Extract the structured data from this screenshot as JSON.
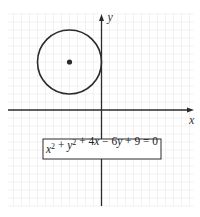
{
  "figure": {
    "type": "circle-on-coordinate-plane",
    "axes": {
      "x_label": "x",
      "y_label": "y"
    },
    "circle": {
      "center": [
        -2,
        3
      ],
      "radius": 2
    },
    "equation": {
      "parts": [
        {
          "t": "x",
          "i": true
        },
        {
          "t": "2",
          "sup": true
        },
        {
          "t": " + "
        },
        {
          "t": "y",
          "i": true
        },
        {
          "t": "2",
          "sup": true
        },
        {
          "t": " + 4"
        },
        {
          "t": "x",
          "i": true
        },
        {
          "t": " − 6"
        },
        {
          "t": "y",
          "i": true
        },
        {
          "t": " + 9 = 0"
        }
      ],
      "text": "x^2 + y^2 + 4x - 6y + 9 = 0"
    },
    "grid": true,
    "colors": {
      "stroke": "#2b2b2b",
      "grid": "#ececec"
    }
  }
}
